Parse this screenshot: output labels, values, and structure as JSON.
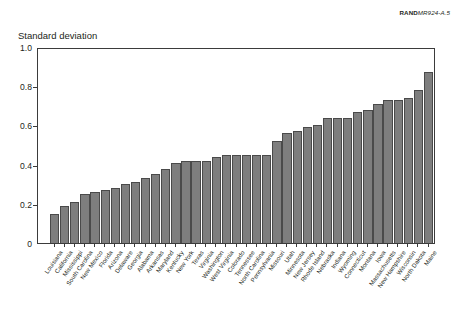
{
  "figure": {
    "source_credit_bold": "RAND",
    "source_credit_italic": "MR924-A.5",
    "y_axis_title": "Standard deviation"
  },
  "chart_data": {
    "type": "bar",
    "title": "",
    "subtitle": "",
    "xlabel": "",
    "ylabel": "Standard deviation",
    "ylim": [
      0,
      1.0
    ],
    "yticks": [
      "0",
      "0.2",
      "0.4",
      "0.6",
      "0.8",
      "1.0"
    ],
    "ytick_values": [
      0,
      0.2,
      0.4,
      0.6,
      0.8,
      1.0
    ],
    "grid": false,
    "legend": null,
    "bar_color": "#7e7e7e",
    "bar_edge_color": "#4a4a4a",
    "categories": [
      "Louisiana",
      "California",
      "Mississippi",
      "South Carolina",
      "New Mexico",
      "Florida",
      "Arizona",
      "Delaware",
      "Georgia",
      "Alabama",
      "Arkansas",
      "Maryland",
      "Kentucky",
      "New York",
      "Texas",
      "Virginia",
      "Washington",
      "West Virginia",
      "Colorado",
      "Tennessee",
      "North Carolina",
      "Pennsylvania",
      "Missouri",
      "Utah",
      "Minnesota",
      "New Jersey",
      "Rhode Island",
      "Nebraska",
      "Indiana",
      "Wyoming",
      "Connecticut",
      "Montana",
      "Iowa",
      "Massachusetts",
      "New Hampshire",
      "Wisconsin",
      "North Dakota",
      "Maine"
    ],
    "values": [
      0.15,
      0.19,
      0.21,
      0.25,
      0.26,
      0.27,
      0.28,
      0.3,
      0.31,
      0.33,
      0.35,
      0.38,
      0.41,
      0.42,
      0.42,
      0.42,
      0.44,
      0.45,
      0.45,
      0.45,
      0.45,
      0.45,
      0.52,
      0.56,
      0.57,
      0.59,
      0.6,
      0.64,
      0.64,
      0.64,
      0.67,
      0.68,
      0.71,
      0.73,
      0.73,
      0.74,
      0.78,
      0.87
    ]
  }
}
